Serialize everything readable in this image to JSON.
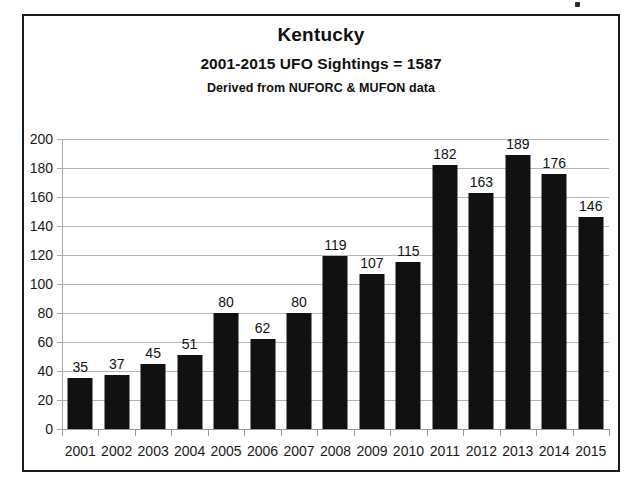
{
  "chart_data": {
    "type": "bar",
    "title": "Kentucky",
    "subtitle": "2001-2015  UFO Sightings = 1587",
    "source_note": "Derived from NUFORC & MUFON data",
    "xlabel": "",
    "ylabel": "",
    "ylim": [
      0,
      200
    ],
    "ytick_step": 20,
    "grid": true,
    "legend": "none",
    "bar_color": "#111111",
    "gridline_color": "#b4b4b4",
    "categories": [
      "2001",
      "2002",
      "2003",
      "2004",
      "2005",
      "2006",
      "2007",
      "2008",
      "2009",
      "2010",
      "2011",
      "2012",
      "2013",
      "2014",
      "2015"
    ],
    "values": [
      35,
      37,
      45,
      51,
      80,
      62,
      80,
      119,
      107,
      115,
      182,
      163,
      189,
      176,
      146
    ],
    "yticks": [
      "0",
      "20",
      "40",
      "60",
      "80",
      "100",
      "120",
      "140",
      "160",
      "180",
      "200"
    ],
    "total": 1587
  }
}
